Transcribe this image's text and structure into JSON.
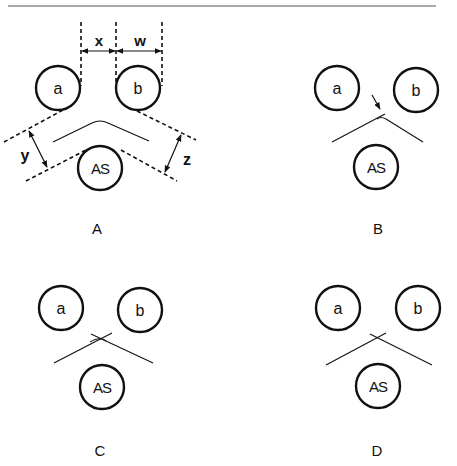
{
  "header": {
    "rule_color": "#555555"
  },
  "panels": {
    "A": {
      "label": "A",
      "circle_a": "a",
      "circle_b": "b",
      "circle_as": "AS",
      "dim_x": "x",
      "dim_w": "w",
      "dim_y": "y",
      "dim_z": "z"
    },
    "B": {
      "label": "B",
      "circle_a": "a",
      "circle_b": "b",
      "circle_as": "AS"
    },
    "C": {
      "label": "C",
      "circle_a": "a",
      "circle_b": "b",
      "circle_as": "AS"
    },
    "D": {
      "label": "D",
      "circle_a": "a",
      "circle_b": "b",
      "circle_as": "AS"
    }
  }
}
